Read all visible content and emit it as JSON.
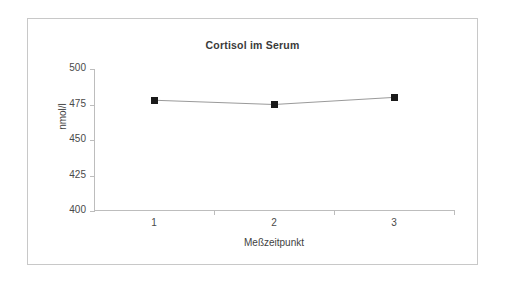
{
  "chart_data": {
    "type": "line",
    "title": "Cortisol im Serum",
    "xlabel": "Meßzeitpunkt",
    "ylabel": "nmol/l",
    "categories": [
      "1",
      "2",
      "3"
    ],
    "values": [
      478,
      475,
      480
    ],
    "series": [
      {
        "name": "Cortisol im Serum",
        "values": [
          478,
          475,
          480
        ]
      }
    ],
    "ylim": [
      400,
      500
    ],
    "yticks": [
      400,
      425,
      450,
      475,
      500
    ],
    "ytick_labels": [
      "400",
      "425",
      "450",
      "475",
      "500"
    ],
    "xticks": [
      "1",
      "2",
      "3"
    ],
    "grid": false,
    "legend": false,
    "legend_position": "none",
    "marker": "square",
    "marker_color": "#1a1a1a",
    "line_color": "#9a9a9a",
    "axis_color": "#bdbdbd",
    "background": "#ffffff",
    "frame_border_color": "#c8c8c8"
  }
}
